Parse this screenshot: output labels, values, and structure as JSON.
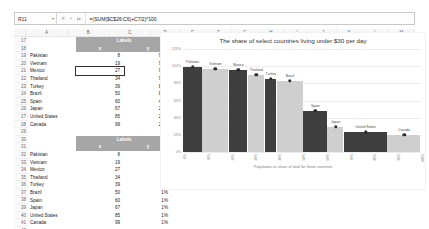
{
  "formula_bar": {
    "name_box": "R11",
    "caret": "▾",
    "cancel_icon": "✕",
    "enter_icon": "✓",
    "fx_icon": "fx",
    "formula": "=(SUM($C$26:C6)+C7/2)*100"
  },
  "grid": {
    "columns": [
      "A",
      "B",
      "C",
      "D",
      "E",
      "F",
      "G",
      "H",
      "I",
      "J",
      "K",
      "L",
      "M"
    ],
    "rows": [
      "17",
      "18",
      "19",
      "20",
      "21",
      "22",
      "23",
      "24",
      "25",
      "26",
      "27",
      "28",
      "29",
      "30",
      "31",
      "32",
      "33",
      "34",
      "35",
      "36",
      "37",
      "38",
      "39",
      "40",
      "41",
      "42"
    ],
    "selected_cell": "B21",
    "table1": {
      "band_title": "Labels",
      "band_sub_b": "x",
      "band_sub_c": "y",
      "rows": [
        {
          "country": "Pakistan",
          "value": "8",
          "percent": "99%"
        },
        {
          "country": "Vietnam",
          "value": "19",
          "percent": "97%"
        },
        {
          "country": "Mexico",
          "value": "27",
          "percent": "96%"
        },
        {
          "country": "Thailand",
          "value": "34",
          "percent": "90%"
        },
        {
          "country": "Turkey",
          "value": "39",
          "percent": "85%"
        },
        {
          "country": "Brazil",
          "value": "50",
          "percent": "83%"
        },
        {
          "country": "Spain",
          "value": "60",
          "percent": "48%"
        },
        {
          "country": "Japan",
          "value": "67",
          "percent": "29%"
        },
        {
          "country": "United States",
          "value": "85",
          "percent": "23%"
        },
        {
          "country": "Canada",
          "value": "99",
          "percent": "20%"
        }
      ]
    },
    "table2": {
      "band_title": "Labels",
      "band_sub_b": "x",
      "band_sub_c": "y",
      "rows": [
        {
          "country": "Pakistan",
          "value": "8",
          "percent": "1%"
        },
        {
          "country": "Vietnam",
          "value": "19",
          "percent": "1%"
        },
        {
          "country": "Mexico",
          "value": "27",
          "percent": "1%"
        },
        {
          "country": "Thailand",
          "value": "34",
          "percent": "1%"
        },
        {
          "country": "Turkey",
          "value": "39",
          "percent": "1%"
        },
        {
          "country": "Brazil",
          "value": "50",
          "percent": "1%"
        },
        {
          "country": "Spain",
          "value": "60",
          "percent": "1%"
        },
        {
          "country": "Japan",
          "value": "67",
          "percent": "1%"
        },
        {
          "country": "United States",
          "value": "85",
          "percent": "1%"
        },
        {
          "country": "Canada",
          "value": "99",
          "percent": "1%"
        }
      ]
    }
  },
  "chart_data": {
    "type": "bar",
    "title": "The share of select countries living under $30 per day",
    "xlabel": "Population as share of total for those countries",
    "ylabel": "",
    "ylim": [
      0,
      120
    ],
    "yticks": [
      "120%",
      "100%",
      "80%",
      "60%",
      "40%",
      "20%",
      "0%"
    ],
    "grid": true,
    "legend": "none",
    "note": "Marimekko / variable-width bar chart: bar width = population share, bar height = share under $30/day",
    "categories": [
      "Pakistan",
      "Vietnam",
      "Mexico",
      "Thailand",
      "Turkey",
      "Brazil",
      "Spain",
      "Japan",
      "United States",
      "Canada"
    ],
    "values": [
      99,
      97,
      96,
      90,
      85,
      83,
      48,
      29,
      23,
      20
    ],
    "widths": [
      8,
      11,
      8,
      7,
      5,
      11,
      10,
      7,
      18,
      14
    ],
    "cumulative_x": [
      8,
      19,
      27,
      34,
      39,
      50,
      60,
      67,
      85,
      99
    ],
    "bar_colors": [
      "#3f3f3f",
      "#cfcfcf",
      "#3f3f3f",
      "#cfcfcf",
      "#3f3f3f",
      "#cfcfcf",
      "#3f3f3f",
      "#cfcfcf",
      "#3f3f3f",
      "#cfcfcf"
    ],
    "xticks": [
      "0%",
      "10%",
      "20%",
      "30%",
      "40%",
      "50%",
      "60%",
      "70%",
      "80%",
      "90%",
      "100%"
    ]
  }
}
